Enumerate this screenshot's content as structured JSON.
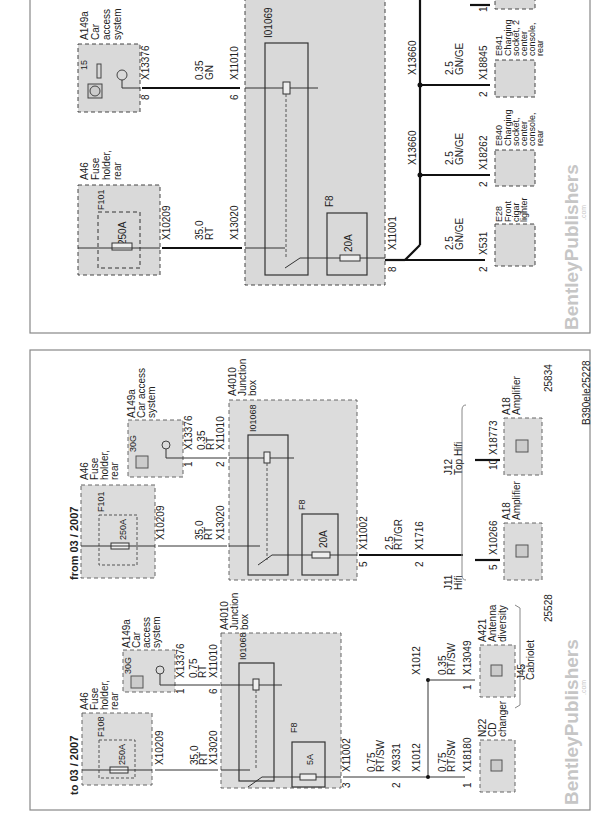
{
  "page": {
    "figure_id": "B390ele25228",
    "watermark": "BentleyPublishers",
    "watermark_suffix": ".com"
  },
  "top_panel": {
    "component_a149a": {
      "id": "A149a",
      "line1": "Car",
      "line2": "access",
      "line3": "system",
      "terminal": "15",
      "connector": "X13376",
      "pin": "8"
    },
    "wire_1": {
      "size": "0.35",
      "color": "GN"
    },
    "component_a46": {
      "id": "A46",
      "line1": "Fuse",
      "line2": "holder,",
      "line3": "rear",
      "fuse_id": "F101",
      "fuse_rating": "250A",
      "connector": "X10209"
    },
    "wire_2": {
      "size": "35.0",
      "color": "RT"
    },
    "junction": {
      "relay_id": "I01069",
      "connector_in1": "X11010",
      "pin_in1": "6",
      "connector_in2": "X13020",
      "fuse_id": "F8",
      "fuse_rating": "20A",
      "connector_out": "X11001",
      "pin_out": "8"
    },
    "splices": [
      {
        "id": "X13660"
      },
      {
        "id": "X13660"
      }
    ],
    "branches": [
      {
        "wire_size": "2.5",
        "wire_color": "GN/GE",
        "connector": "X531",
        "pin": "2",
        "id": "E28",
        "line1": "Front",
        "line2": "cigar",
        "line3": "lighter"
      },
      {
        "wire_size": "2.5",
        "wire_color": "GN/GE",
        "connector": "X18262",
        "pin": "2",
        "id": "E840",
        "line1": "Charging",
        "line2": "socket,",
        "line3": "center",
        "line4": "console,",
        "line5": "rear"
      },
      {
        "wire_size": "2.5",
        "wire_color": "GN/GE",
        "connector": "X18845",
        "pin": "2",
        "id": "E841",
        "line1": "Charging",
        "line2": "socket, 2",
        "line3": "center",
        "line4": "console,",
        "line5": "rear"
      }
    ],
    "top_partial_pin": "1"
  },
  "bottom_panel": {
    "left": {
      "title": "to 03 / 2007",
      "component_a46": {
        "id": "A46",
        "line1": "Fuse",
        "line2": "holder,",
        "line3": "rear",
        "fuse_id": "F108",
        "fuse_rating": "250A",
        "connector": "X10209"
      },
      "wire_main": {
        "size": "35.0",
        "color": "RT"
      },
      "component_a149a": {
        "id": "A149a",
        "line1": "Car",
        "line2": "access",
        "line3": "system",
        "terminal": "30G",
        "connector": "X13376",
        "pin": "1"
      },
      "wire_ctrl": {
        "size": "0.75",
        "color": "RT"
      },
      "junction": {
        "id": "A4010",
        "line1": "Junction",
        "line2": "box",
        "relay_id": "I01068",
        "connector_in1": "X11010",
        "pin_in1": "6",
        "connector_in2": "X13020",
        "fuse_id": "F8",
        "fuse_rating": "5A",
        "connector_out": "X11002",
        "pin_out": "3"
      },
      "wire_out": {
        "size": "0.75",
        "color": "RT/SW"
      },
      "connector_mid": {
        "id": "X9331",
        "pin": "2"
      },
      "splice_1": "X1012",
      "splice_2": "X1012",
      "cd": {
        "wire_size": "0.75",
        "wire_color": "RT/SW",
        "connector": "X18180",
        "pin": "1",
        "id": "N22",
        "line1": "CD",
        "line2": "changer"
      },
      "antenna": {
        "wire_size": "0.35",
        "wire_color": "RT/SW",
        "connector": "X13049",
        "pin": "1",
        "id": "A421",
        "line1": "Antenna",
        "line2": "diversity"
      },
      "option_j45": {
        "id": "J45",
        "label": "Cabriolet"
      },
      "ref": "25528"
    },
    "right": {
      "title": "from 03 / 2007",
      "component_a46": {
        "id": "A46",
        "line1": "Fuse",
        "line2": "holder,",
        "line3": "rear",
        "fuse_id": "F101",
        "fuse_rating": "250A",
        "connector": "X10209"
      },
      "wire_main": {
        "size": "35.0",
        "color": "RT"
      },
      "component_a149a": {
        "id": "A149a",
        "line1": "Car access",
        "line2": "system",
        "terminal": "30G",
        "connector": "X13376",
        "pin": "1"
      },
      "wire_ctrl": {
        "size": "0.35",
        "color": "RT"
      },
      "junction": {
        "id": "A4010",
        "line1": "Junction",
        "line2": "box",
        "relay_id": "I01068",
        "connector_in1": "X11010",
        "pin_in1": "2",
        "connector_in2": "X13020",
        "fuse_id": "F8",
        "fuse_rating": "20A",
        "connector_out": "X11002",
        "pin_out": "5"
      },
      "wire_out": {
        "size": "2.5",
        "color": "RT/GR"
      },
      "connector_mid": {
        "id": "X1716",
        "pin": "2"
      },
      "option_j11": {
        "id": "J11",
        "label": "Hifi"
      },
      "amp1": {
        "connector": "X10266",
        "pin": "5",
        "id": "A18",
        "label": "Amplifier"
      },
      "option_j12": {
        "id": "J12",
        "label": "Top Hifi"
      },
      "amp2": {
        "connector": "X18773",
        "pin": "10",
        "id": "A18",
        "label": "Amplifier"
      },
      "ref": "25834"
    }
  }
}
